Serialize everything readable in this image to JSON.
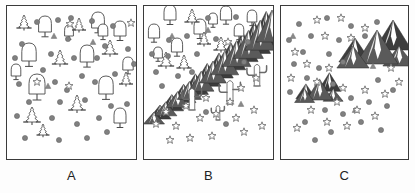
{
  "figure": {
    "type": "ecology-symbol-map-triptych",
    "panel_count": 3,
    "background_color": "#ffffff",
    "border_color": "#3a3a3a",
    "symbol_colors": {
      "circle_fill": "#808080",
      "star_outline": "#707070",
      "tree_outline": "#4a4a4a",
      "mountain_dark": "#5a5a5a",
      "mountain_shadow": "#3d3d3d",
      "mountain_snow": "#ffffff",
      "cactus_outline": "#6a6a6a",
      "triangle_fill": "#8a8a8a"
    }
  },
  "panels": [
    {
      "id": "A",
      "label": "A",
      "description": "forest habitat",
      "legend_symbols": [
        "conifer-tree",
        "broadleaf-tree",
        "filled-circle",
        "open-star",
        "small-triangle"
      ],
      "counts": {
        "conifer_tree": 8,
        "broadleaf_tree": 12,
        "circle": 34,
        "star": 4,
        "triangle": 3,
        "mountain": 0,
        "cactus": 0
      },
      "conifers": [
        {
          "x": 17,
          "y": 22,
          "s": 13
        },
        {
          "x": 72,
          "y": 24,
          "s": 12
        },
        {
          "x": 53,
          "y": 58,
          "s": 14
        },
        {
          "x": 103,
          "y": 48,
          "s": 14
        },
        {
          "x": 119,
          "y": 78,
          "s": 12
        },
        {
          "x": 70,
          "y": 104,
          "s": 15
        },
        {
          "x": 25,
          "y": 116,
          "s": 15
        },
        {
          "x": 36,
          "y": 129,
          "s": 11
        }
      ],
      "broadleaf": [
        {
          "x": 38,
          "y": 26,
          "s": 16
        },
        {
          "x": 91,
          "y": 22,
          "s": 16
        },
        {
          "x": 113,
          "y": 30,
          "s": 15
        },
        {
          "x": 22,
          "y": 55,
          "s": 18
        },
        {
          "x": 80,
          "y": 56,
          "s": 17
        },
        {
          "x": 121,
          "y": 64,
          "s": 13
        },
        {
          "x": 96,
          "y": 30,
          "s": 12
        },
        {
          "x": 30,
          "y": 88,
          "s": 20
        },
        {
          "x": 99,
          "y": 88,
          "s": 18
        },
        {
          "x": 113,
          "y": 117,
          "s": 15
        },
        {
          "x": 62,
          "y": 30,
          "s": 11
        },
        {
          "x": 9,
          "y": 70,
          "s": 12
        }
      ],
      "circles": [
        {
          "x": 30,
          "y": 16
        },
        {
          "x": 51,
          "y": 14
        },
        {
          "x": 85,
          "y": 15
        },
        {
          "x": 106,
          "y": 20
        },
        {
          "x": 15,
          "y": 38
        },
        {
          "x": 61,
          "y": 33
        },
        {
          "x": 98,
          "y": 40
        },
        {
          "x": 121,
          "y": 43
        },
        {
          "x": 8,
          "y": 52
        },
        {
          "x": 44,
          "y": 48
        },
        {
          "x": 67,
          "y": 52
        },
        {
          "x": 90,
          "y": 52
        },
        {
          "x": 36,
          "y": 64
        },
        {
          "x": 75,
          "y": 70
        },
        {
          "x": 108,
          "y": 68
        },
        {
          "x": 127,
          "y": 58
        },
        {
          "x": 12,
          "y": 78
        },
        {
          "x": 48,
          "y": 76
        },
        {
          "x": 60,
          "y": 84
        },
        {
          "x": 88,
          "y": 76
        },
        {
          "x": 22,
          "y": 96
        },
        {
          "x": 53,
          "y": 96
        },
        {
          "x": 78,
          "y": 94
        },
        {
          "x": 104,
          "y": 100
        },
        {
          "x": 10,
          "y": 110
        },
        {
          "x": 45,
          "y": 112
        },
        {
          "x": 70,
          "y": 118
        },
        {
          "x": 92,
          "y": 112
        },
        {
          "x": 120,
          "y": 98
        },
        {
          "x": 18,
          "y": 132
        },
        {
          "x": 52,
          "y": 134
        },
        {
          "x": 80,
          "y": 132
        },
        {
          "x": 100,
          "y": 126
        },
        {
          "x": 64,
          "y": 12
        }
      ],
      "stars": [
        {
          "x": 63,
          "y": 18
        },
        {
          "x": 124,
          "y": 17
        },
        {
          "x": 62,
          "y": 80
        },
        {
          "x": 30,
          "y": 76
        }
      ],
      "triangles": [
        {
          "x": 47,
          "y": 30
        },
        {
          "x": 41,
          "y": 80
        },
        {
          "x": 86,
          "y": 36
        }
      ],
      "mountains": [],
      "cacti": []
    },
    {
      "id": "B",
      "label": "B",
      "description": "forest to desert transition with mountain range",
      "legend_symbols": [
        "conifer-tree",
        "broadleaf-tree",
        "mountain-range",
        "saguaro-cactus",
        "open-star",
        "filled-circle",
        "small-triangle"
      ],
      "counts": {
        "conifer_tree": 5,
        "broadleaf_tree": 9,
        "circle": 16,
        "star": 18,
        "triangle": 3,
        "mountain": 1,
        "cactus": 4
      },
      "conifers": [
        {
          "x": 48,
          "y": 16,
          "s": 13
        },
        {
          "x": 22,
          "y": 60,
          "s": 14
        },
        {
          "x": 40,
          "y": 62,
          "s": 13
        },
        {
          "x": 77,
          "y": 44,
          "s": 13
        },
        {
          "x": 60,
          "y": 38,
          "s": 12
        }
      ],
      "broadleaf": [
        {
          "x": 26,
          "y": 14,
          "s": 15
        },
        {
          "x": 82,
          "y": 14,
          "s": 14
        },
        {
          "x": 108,
          "y": 16,
          "s": 12
        },
        {
          "x": 10,
          "y": 32,
          "s": 14
        },
        {
          "x": 56,
          "y": 28,
          "s": 15
        },
        {
          "x": 33,
          "y": 46,
          "s": 14
        },
        {
          "x": 69,
          "y": 18,
          "s": 11
        },
        {
          "x": 95,
          "y": 30,
          "s": 12
        },
        {
          "x": 14,
          "y": 52,
          "s": 11
        }
      ],
      "circles": [
        {
          "x": 64,
          "y": 12
        },
        {
          "x": 92,
          "y": 11
        },
        {
          "x": 43,
          "y": 30
        },
        {
          "x": 25,
          "y": 34
        },
        {
          "x": 72,
          "y": 33
        },
        {
          "x": 8,
          "y": 48
        },
        {
          "x": 24,
          "y": 50
        },
        {
          "x": 53,
          "y": 48
        },
        {
          "x": 12,
          "y": 66
        },
        {
          "x": 34,
          "y": 70
        },
        {
          "x": 18,
          "y": 80
        },
        {
          "x": 48,
          "y": 66
        },
        {
          "x": 62,
          "y": 106
        },
        {
          "x": 82,
          "y": 118
        },
        {
          "x": 104,
          "y": 36
        },
        {
          "x": 100,
          "y": 56
        }
      ],
      "stars": [
        {
          "x": 84,
          "y": 36
        },
        {
          "x": 112,
          "y": 72
        },
        {
          "x": 97,
          "y": 82
        },
        {
          "x": 86,
          "y": 96
        },
        {
          "x": 62,
          "y": 92
        },
        {
          "x": 42,
          "y": 100
        },
        {
          "x": 22,
          "y": 106
        },
        {
          "x": 12,
          "y": 118
        },
        {
          "x": 32,
          "y": 120
        },
        {
          "x": 56,
          "y": 112
        },
        {
          "x": 72,
          "y": 108
        },
        {
          "x": 92,
          "y": 112
        },
        {
          "x": 110,
          "y": 104
        },
        {
          "x": 118,
          "y": 120
        },
        {
          "x": 46,
          "y": 132
        },
        {
          "x": 68,
          "y": 130
        },
        {
          "x": 26,
          "y": 134
        },
        {
          "x": 100,
          "y": 126
        }
      ],
      "triangles": [
        {
          "x": 64,
          "y": 24
        },
        {
          "x": 28,
          "y": 30
        },
        {
          "x": 97,
          "y": 98
        }
      ],
      "mountains": [
        {
          "type": "diagonal-range",
          "from_x": 10,
          "from_y": 118,
          "to_x": 128,
          "to_y": 36
        }
      ],
      "cacti": [
        {
          "x": 48,
          "y": 104,
          "s": 24
        },
        {
          "x": 86,
          "y": 98,
          "s": 26
        },
        {
          "x": 113,
          "y": 80,
          "s": 24
        },
        {
          "x": 74,
          "y": 114,
          "s": 16
        }
      ]
    },
    {
      "id": "C",
      "label": "C",
      "description": "alpine habitat with mountain clusters",
      "legend_symbols": [
        "mountain-cluster",
        "open-star",
        "filled-circle",
        "small-triangle"
      ],
      "counts": {
        "conifer_tree": 0,
        "broadleaf_tree": 0,
        "circle": 28,
        "star": 22,
        "triangle": 3,
        "mountain": 2,
        "cactus": 0
      },
      "conifers": [],
      "broadleaf": [],
      "circles": [
        {
          "x": 18,
          "y": 18
        },
        {
          "x": 46,
          "y": 12
        },
        {
          "x": 70,
          "y": 20
        },
        {
          "x": 96,
          "y": 16
        },
        {
          "x": 8,
          "y": 34
        },
        {
          "x": 30,
          "y": 30
        },
        {
          "x": 58,
          "y": 34
        },
        {
          "x": 84,
          "y": 30
        },
        {
          "x": 22,
          "y": 46
        },
        {
          "x": 48,
          "y": 48
        },
        {
          "x": 13,
          "y": 58
        },
        {
          "x": 38,
          "y": 62
        },
        {
          "x": 62,
          "y": 56
        },
        {
          "x": 26,
          "y": 72
        },
        {
          "x": 9,
          "y": 86
        },
        {
          "x": 52,
          "y": 78
        },
        {
          "x": 97,
          "y": 74
        },
        {
          "x": 112,
          "y": 84
        },
        {
          "x": 70,
          "y": 92
        },
        {
          "x": 88,
          "y": 96
        },
        {
          "x": 106,
          "y": 100
        },
        {
          "x": 44,
          "y": 104
        },
        {
          "x": 62,
          "y": 108
        },
        {
          "x": 24,
          "y": 116
        },
        {
          "x": 80,
          "y": 116
        },
        {
          "x": 50,
          "y": 126
        },
        {
          "x": 100,
          "y": 124
        },
        {
          "x": 34,
          "y": 134
        }
      ],
      "stars": [
        {
          "x": 36,
          "y": 14
        },
        {
          "x": 60,
          "y": 12
        },
        {
          "x": 84,
          "y": 22
        },
        {
          "x": 14,
          "y": 46
        },
        {
          "x": 44,
          "y": 30
        },
        {
          "x": 70,
          "y": 32
        },
        {
          "x": 26,
          "y": 58
        },
        {
          "x": 48,
          "y": 62
        },
        {
          "x": 10,
          "y": 72
        },
        {
          "x": 36,
          "y": 76
        },
        {
          "x": 62,
          "y": 82
        },
        {
          "x": 84,
          "y": 84
        },
        {
          "x": 104,
          "y": 88
        },
        {
          "x": 118,
          "y": 76
        },
        {
          "x": 56,
          "y": 96
        },
        {
          "x": 76,
          "y": 104
        },
        {
          "x": 94,
          "y": 110
        },
        {
          "x": 30,
          "y": 104
        },
        {
          "x": 46,
          "y": 116
        },
        {
          "x": 66,
          "y": 120
        },
        {
          "x": 16,
          "y": 122
        },
        {
          "x": 110,
          "y": 62
        }
      ],
      "triangles": [
        {
          "x": 12,
          "y": 30
        },
        {
          "x": 74,
          "y": 104
        },
        {
          "x": 92,
          "y": 60
        }
      ],
      "mountains": [
        {
          "type": "cluster-large",
          "x": 92,
          "y": 58,
          "s": 1.0
        },
        {
          "type": "cluster-small",
          "x": 36,
          "y": 94,
          "s": 0.62
        }
      ],
      "cacti": []
    }
  ]
}
